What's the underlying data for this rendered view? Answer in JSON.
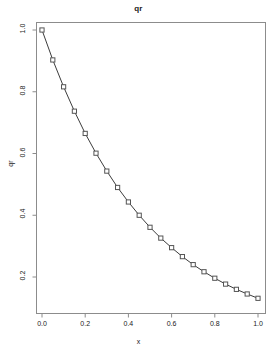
{
  "chart_data": {
    "type": "line",
    "title": "qr",
    "xlabel": "x",
    "ylabel": "qr",
    "xlim": [
      0,
      1
    ],
    "ylim": [
      0.13,
      1.0
    ],
    "grid": false,
    "legend": null,
    "marker": "square",
    "line_color": "#3c3c3c",
    "marker_color": "#555555",
    "xticks": [
      "0.0",
      "0.2",
      "0.4",
      "0.6",
      "0.8",
      "1.0"
    ],
    "xtick_values": [
      0.0,
      0.2,
      0.4,
      0.6,
      0.8,
      1.0
    ],
    "yticks": [
      "0.2",
      "0.4",
      "0.6",
      "0.8",
      "1.0"
    ],
    "ytick_values": [
      0.2,
      0.4,
      0.6,
      0.8,
      1.0
    ],
    "x": [
      0.0,
      0.05,
      0.1,
      0.15,
      0.2,
      0.25,
      0.3,
      0.35,
      0.4,
      0.45,
      0.5,
      0.55,
      0.6,
      0.65,
      0.7,
      0.75,
      0.8,
      0.85,
      0.9,
      0.95,
      1.0
    ],
    "values": [
      1.0,
      0.903,
      0.816,
      0.737,
      0.665,
      0.601,
      0.543,
      0.49,
      0.443,
      0.4,
      0.361,
      0.326,
      0.295,
      0.266,
      0.24,
      0.217,
      0.196,
      0.177,
      0.16,
      0.145,
      0.131
    ]
  },
  "axis": {
    "box_color": "#8c8c8c"
  }
}
